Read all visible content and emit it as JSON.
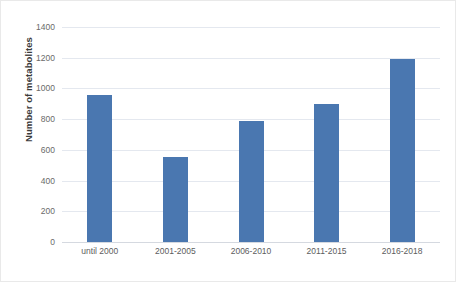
{
  "chart_data": {
    "type": "bar",
    "title": "",
    "subtitle": "",
    "xlabel": "",
    "ylabel": "Number of metabolites",
    "categories": [
      "until 2000",
      "2001-2005",
      "2006-2010",
      "2011-2015",
      "2016-2018"
    ],
    "values": [
      960,
      555,
      790,
      900,
      1190
    ],
    "series": [
      {
        "name": "Number of metabolites",
        "values": [
          960,
          555,
          790,
          900,
          1190
        ]
      }
    ],
    "ylim": [
      0,
      1400
    ],
    "y_ticks": [
      0,
      200,
      400,
      600,
      800,
      1000,
      1200,
      1400
    ],
    "y_tick_labels": [
      "0",
      "200",
      "400",
      "600",
      "800",
      "1000",
      "1200",
      "1400"
    ],
    "grid": true,
    "grid_axis": "y",
    "legend": false,
    "legend_position": "none",
    "bar_color": "#4A77B0",
    "gridline_color": "#E4E8EF",
    "axis_text_color": "#6A6A6A",
    "background_color": "#FFFFFF"
  }
}
